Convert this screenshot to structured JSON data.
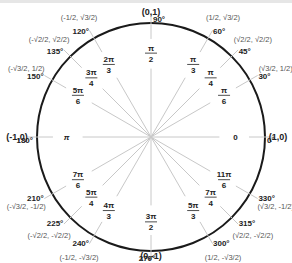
{
  "diagram": {
    "center_px": [
      151,
      137
    ],
    "radius_px": 114,
    "colors": {
      "circle": "#1a1a1a",
      "spokes": "#c8c8c8",
      "text": "#222222",
      "coord_text": "#555555"
    },
    "axis_points": [
      {
        "label": "(0,1)",
        "x": 151,
        "y": 15
      },
      {
        "label": "(0,-1)",
        "x": 151,
        "y": 259
      },
      {
        "label": "(-1,0)",
        "x": 17,
        "y": 140
      },
      {
        "label": "(1,0)",
        "x": 278,
        "y": 140
      }
    ],
    "angles": [
      {
        "deg": 0,
        "deg_label": "0°",
        "rad_num": "0",
        "rad_den": "",
        "coord": ""
      },
      {
        "deg": 30,
        "deg_label": "30°",
        "rad_num": "π",
        "rad_den": "6",
        "coord": [
          "√3/2",
          "1/2"
        ]
      },
      {
        "deg": 45,
        "deg_label": "45°",
        "rad_num": "π",
        "rad_den": "4",
        "coord": [
          "√2/2",
          "√2/2"
        ]
      },
      {
        "deg": 60,
        "deg_label": "60°",
        "rad_num": "π",
        "rad_den": "3",
        "coord": [
          "1/2",
          "√3/2"
        ]
      },
      {
        "deg": 90,
        "deg_label": "90°",
        "rad_num": "π",
        "rad_den": "2",
        "coord": ""
      },
      {
        "deg": 120,
        "deg_label": "120°",
        "rad_num": "2π",
        "rad_den": "3",
        "coord": [
          "-1/2",
          "√3/2"
        ]
      },
      {
        "deg": 135,
        "deg_label": "135°",
        "rad_num": "3π",
        "rad_den": "4",
        "coord": [
          "-√2/2",
          "√2/2"
        ]
      },
      {
        "deg": 150,
        "deg_label": "150°",
        "rad_num": "5π",
        "rad_den": "6",
        "coord": [
          "-√3/2",
          "1/2"
        ]
      },
      {
        "deg": 180,
        "deg_label": "180°",
        "rad_num": "π",
        "rad_den": "",
        "coord": ""
      },
      {
        "deg": 210,
        "deg_label": "210°",
        "rad_num": "7π",
        "rad_den": "6",
        "coord": [
          "-√3/2",
          "-1/2"
        ]
      },
      {
        "deg": 225,
        "deg_label": "225°",
        "rad_num": "5π",
        "rad_den": "4",
        "coord": [
          "-√2/2",
          "-√2/2"
        ]
      },
      {
        "deg": 240,
        "deg_label": "240°",
        "rad_num": "4π",
        "rad_den": "3",
        "coord": [
          "-1/2",
          "-√3/2"
        ]
      },
      {
        "deg": 270,
        "deg_label": "270°",
        "rad_num": "3π",
        "rad_den": "2",
        "coord": ""
      },
      {
        "deg": 300,
        "deg_label": "300°",
        "rad_num": "5π",
        "rad_den": "3",
        "coord": [
          "1/2",
          "-√3/2"
        ]
      },
      {
        "deg": 315,
        "deg_label": "315°",
        "rad_num": "7π",
        "rad_den": "4",
        "coord": [
          "√2/2",
          "-√2/2"
        ]
      },
      {
        "deg": 330,
        "deg_label": "330°",
        "rad_num": "11π",
        "rad_den": "6",
        "coord": [
          "√3/2",
          "-1/2"
        ]
      }
    ]
  }
}
